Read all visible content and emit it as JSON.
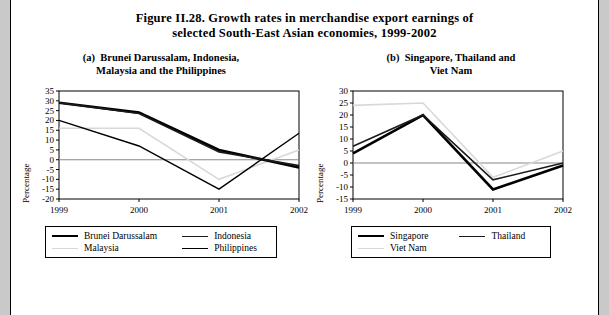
{
  "figure": {
    "title_line1": "Figure II.28.  Growth rates in merchandise export earnings of",
    "title_line2": "selected South-East Asian economies, 1999-2002"
  },
  "panel_a": {
    "subtitle_label": "(a)",
    "subtitle_line1": "Brunei Darussalam, Indonesia,",
    "subtitle_line2": "Malaysia and the Philippines",
    "ylabel": "Percentage",
    "legend": [
      {
        "label": "Brunei Darussalam",
        "color": "#000000",
        "width": 2.6
      },
      {
        "label": "Indonesia",
        "color": "#1a1a1a",
        "width": 1.6
      },
      {
        "label": "Malaysia",
        "color": "#d8d8d8",
        "width": 1.6
      },
      {
        "label": "Philippines",
        "color": "#000000",
        "width": 1.4
      }
    ]
  },
  "panel_b": {
    "subtitle_label": "(b)",
    "subtitle_line1": "Singapore, Thailand and",
    "subtitle_line2": "Viet Nam",
    "ylabel": "Percentage",
    "legend": [
      {
        "label": "Singapore",
        "color": "#000000",
        "width": 2.6
      },
      {
        "label": "Thailand",
        "color": "#1a1a1a",
        "width": 1.6
      },
      {
        "label": "Viet Nam",
        "color": "#d8d8d8",
        "width": 1.6
      }
    ]
  },
  "chart_data": [
    {
      "id": "panel-a",
      "type": "line",
      "title": "(a) Brunei Darussalam, Indonesia, Malaysia and the Philippines",
      "xlabel": "",
      "ylabel": "Percentage",
      "x": [
        "1999",
        "2000",
        "2001",
        "2002"
      ],
      "yticks": [
        35,
        30,
        25,
        20,
        15,
        10,
        5,
        0,
        -5,
        -10,
        -15,
        -20
      ],
      "ylim": [
        -20,
        35
      ],
      "grid": false,
      "legend_position": "below",
      "series": [
        {
          "name": "Brunei Darussalam",
          "color": "#000000",
          "width": 2.6,
          "values": [
            29,
            24,
            5,
            -4
          ]
        },
        {
          "name": "Indonesia",
          "color": "#1a1a1a",
          "width": 1.6,
          "values": [
            29,
            23.5,
            4,
            -3
          ]
        },
        {
          "name": "Malaysia",
          "color": "#d8d8d8",
          "width": 1.6,
          "values": [
            16,
            16,
            -10,
            5
          ]
        },
        {
          "name": "Philippines",
          "color": "#000000",
          "width": 1.4,
          "values": [
            20,
            7,
            -15,
            13.5
          ]
        }
      ]
    },
    {
      "id": "panel-b",
      "type": "line",
      "title": "(b) Singapore, Thailand and Viet Nam",
      "xlabel": "",
      "ylabel": "Percentage",
      "x": [
        "1999",
        "2000",
        "2001",
        "2002"
      ],
      "yticks": [
        30,
        25,
        20,
        15,
        10,
        5,
        0,
        -5,
        -10,
        -15
      ],
      "ylim": [
        -15,
        30
      ],
      "grid": false,
      "legend_position": "below",
      "series": [
        {
          "name": "Singapore",
          "color": "#000000",
          "width": 2.6,
          "values": [
            4,
            20,
            -11,
            -1
          ]
        },
        {
          "name": "Thailand",
          "color": "#1a1a1a",
          "width": 1.6,
          "values": [
            7,
            20,
            -7,
            0
          ]
        },
        {
          "name": "Viet Nam",
          "color": "#d8d8d8",
          "width": 1.6,
          "values": [
            24,
            25,
            -6,
            5
          ]
        }
      ]
    }
  ]
}
